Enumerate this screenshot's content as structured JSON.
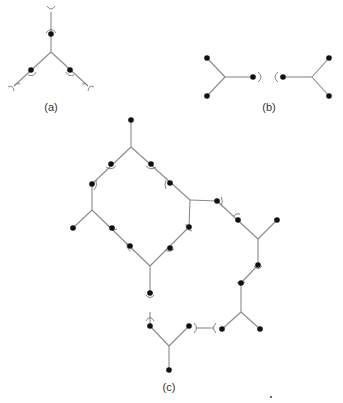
{
  "figure": {
    "panels": [
      {
        "id": "a",
        "label": "(a)"
      },
      {
        "id": "b",
        "label": "(b)"
      },
      {
        "id": "c",
        "label": "(c)"
      }
    ],
    "colors": {
      "edge": "#8a8a8a",
      "node": "#111111",
      "background": "#ffffff"
    }
  }
}
